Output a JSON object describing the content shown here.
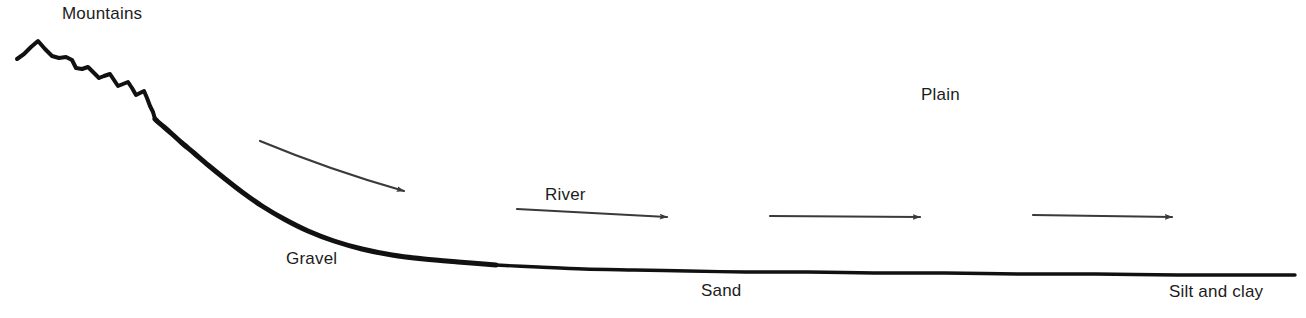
{
  "figure": {
    "background_color": "#ffffff",
    "width": 1306,
    "height": 318
  },
  "labels": {
    "mountains": "Mountains",
    "plain": "Plain",
    "gravel": "Gravel",
    "river": "River",
    "sand": "Sand",
    "silt_and_clay": "Silt and clay"
  },
  "colors": {
    "profile_line": "#111111",
    "arrow": "#3a3a3a",
    "text": "#1c1c1c",
    "background": "#ffffff"
  },
  "chart_data": {
    "type": "line",
    "xlabel": "",
    "ylabel": "",
    "grid": false,
    "legend": "none",
    "xlim": [
      0,
      1306
    ],
    "ylim": [
      318,
      0
    ],
    "series": [
      {
        "name": "Land surface profile",
        "description": "Jagged mountain crest grading into a smooth concave river profile that flattens across the plain",
        "stroke_width_px": [
          3.5,
          5.5
        ],
        "points": [
          [
            17,
            59
          ],
          [
            24,
            54
          ],
          [
            31,
            47
          ],
          [
            38,
            41
          ],
          [
            45,
            49
          ],
          [
            52,
            56
          ],
          [
            59,
            58
          ],
          [
            66,
            57
          ],
          [
            72,
            60
          ],
          [
            76,
            68
          ],
          [
            82,
            69
          ],
          [
            88,
            67
          ],
          [
            93,
            72
          ],
          [
            99,
            78
          ],
          [
            104,
            76
          ],
          [
            110,
            74
          ],
          [
            114,
            80
          ],
          [
            118,
            86
          ],
          [
            123,
            84
          ],
          [
            128,
            82
          ],
          [
            132,
            88
          ],
          [
            136,
            95
          ],
          [
            140,
            93
          ],
          [
            144,
            91
          ],
          [
            147,
            98
          ],
          [
            150,
            106
          ],
          [
            153,
            112
          ],
          [
            155,
            119
          ],
          [
            158,
            122
          ],
          [
            164,
            127
          ],
          [
            172,
            134
          ],
          [
            182,
            143
          ],
          [
            194,
            153
          ],
          [
            208,
            165
          ],
          [
            224,
            178
          ],
          [
            242,
            192
          ],
          [
            262,
            206
          ],
          [
            284,
            219
          ],
          [
            308,
            231
          ],
          [
            334,
            241
          ],
          [
            362,
            249
          ],
          [
            392,
            255
          ],
          [
            424,
            259
          ],
          [
            458,
            262
          ],
          [
            496,
            265
          ],
          [
            538,
            267
          ],
          [
            584,
            269
          ],
          [
            634,
            270
          ],
          [
            688,
            271
          ],
          [
            746,
            272
          ],
          [
            808,
            272
          ],
          [
            874,
            273
          ],
          [
            944,
            273
          ],
          [
            1018,
            274
          ],
          [
            1096,
            274
          ],
          [
            1178,
            275
          ],
          [
            1240,
            275
          ],
          [
            1295,
            275
          ]
        ]
      }
    ],
    "annotations": [
      {
        "id": "mountains-label",
        "text": "Mountains",
        "x": 62,
        "y": 19,
        "anchor": "start",
        "font_size": 17
      },
      {
        "id": "plain-label",
        "text": "Plain",
        "x": 921,
        "y": 100,
        "anchor": "start",
        "font_size": 17
      },
      {
        "id": "gravel-label",
        "text": "Gravel",
        "x": 286,
        "y": 264,
        "anchor": "start",
        "font_size": 17
      },
      {
        "id": "river-label",
        "text": "River",
        "x": 545,
        "y": 200,
        "anchor": "start",
        "font_size": 17
      },
      {
        "id": "sand-label",
        "text": "Sand",
        "x": 701,
        "y": 296,
        "anchor": "start",
        "font_size": 17
      },
      {
        "id": "silt-clay-label",
        "text": "Silt and clay",
        "x": 1169,
        "y": 297,
        "anchor": "start",
        "font_size": 17
      }
    ],
    "flow_arrows": [
      {
        "id": "arrow-1-gravel-reach",
        "shape": "curved",
        "x1": 260,
        "y1": 141,
        "cx": 330,
        "cy": 170,
        "x2": 404,
        "y2": 191,
        "stroke_width": 2.2
      },
      {
        "id": "arrow-2-river-reach",
        "shape": "straight",
        "x1": 517,
        "y1": 209,
        "x2": 667,
        "y2": 217,
        "stroke_width": 2.2
      },
      {
        "id": "arrow-3-plain-reach",
        "shape": "straight",
        "x1": 770,
        "y1": 216,
        "x2": 920,
        "y2": 217,
        "stroke_width": 2.2
      },
      {
        "id": "arrow-4-distal-reach",
        "shape": "straight",
        "x1": 1033,
        "y1": 215,
        "x2": 1172,
        "y2": 217,
        "stroke_width": 2.2
      }
    ]
  }
}
